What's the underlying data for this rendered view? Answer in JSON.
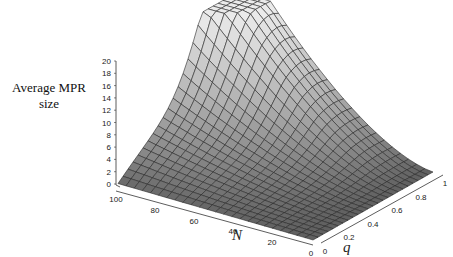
{
  "chart_data": {
    "type": "surface3d",
    "title": "",
    "zlabel": "Average MPR size",
    "xlabel": "N",
    "ylabel": "q",
    "x_axis": {
      "name": "N",
      "ticks": [
        100,
        80,
        60,
        40,
        20,
        0
      ],
      "range": [
        0,
        100
      ]
    },
    "y_axis": {
      "name": "q",
      "ticks": [
        0,
        0.2,
        0.4,
        0.6,
        0.8,
        1
      ],
      "range": [
        0,
        1
      ]
    },
    "z_axis": {
      "ticks": [
        0,
        2,
        4,
        6,
        8,
        10,
        12,
        14,
        16,
        18,
        20
      ],
      "range": [
        0,
        20
      ]
    },
    "grid": true,
    "surface_shading": "grayscale gradient, lighter at higher values",
    "sample_points": [
      {
        "N": 0,
        "q": 0,
        "z": 0
      },
      {
        "N": 100,
        "q": 0,
        "z": 1
      },
      {
        "N": 0,
        "q": 1,
        "z": 0
      },
      {
        "N": 100,
        "q": 0.5,
        "z": 8
      },
      {
        "N": 100,
        "q": 0.9,
        "z": 20
      },
      {
        "N": 50,
        "q": 1,
        "z": 8
      },
      {
        "N": 20,
        "q": 1,
        "z": 3
      },
      {
        "N": 50,
        "q": 0.5,
        "z": 3
      }
    ]
  },
  "labels": {
    "zlabel_line1": "Average MPR",
    "zlabel_line2": "size",
    "xlabel": "N",
    "ylabel": "q"
  }
}
